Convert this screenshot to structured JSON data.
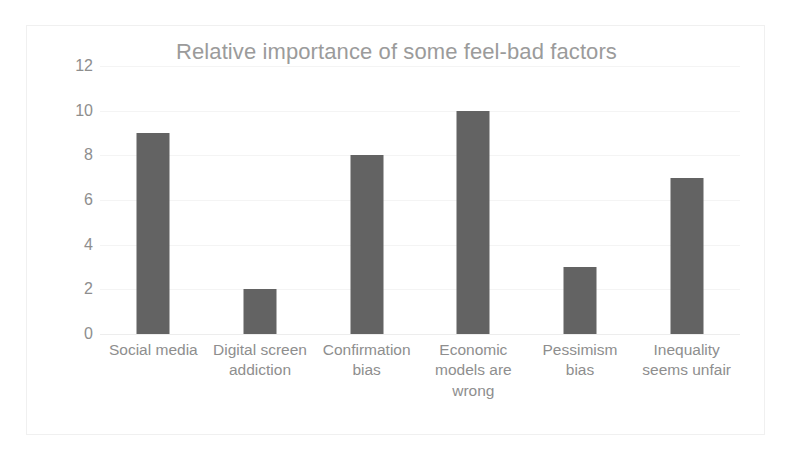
{
  "chart_data": {
    "type": "bar",
    "title": "Relative importance of some feel-bad factors",
    "subtitle": "",
    "xlabel": "",
    "ylabel": "",
    "categories": [
      "Social media",
      "Digital screen addiction",
      "Confirmation bias",
      "Economic models are wrong",
      "Pessimism bias",
      "Inequality seems unfair"
    ],
    "values": [
      9,
      2,
      8,
      10,
      3,
      7
    ],
    "ylim": [
      0,
      12
    ],
    "ytick_labels": [
      "12",
      "10",
      "8",
      "6",
      "4",
      "2",
      "0"
    ],
    "ytick_values": [
      12,
      10,
      8,
      6,
      4,
      2,
      0
    ],
    "ytick_step": 2,
    "grid": true,
    "grid_axis": "y",
    "legend": false,
    "legend_position": "none",
    "bar_color": "#636363",
    "title_color": "#9b9b9b",
    "tick_label_color": "#8e8e8e",
    "gridline_color": "#f4f4f4",
    "plot_background": "#ffffff",
    "frame_border_color": "#f0f0f0"
  }
}
